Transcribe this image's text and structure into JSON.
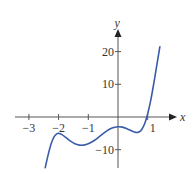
{
  "chart_data": {
    "type": "line",
    "title": "",
    "xlabel": "x",
    "ylabel": "y",
    "xlim": [
      -3.4,
      2.0
    ],
    "ylim": [
      -15.5,
      26
    ],
    "grid": false,
    "legend": null,
    "x_ticks": [
      -3,
      -2,
      -1,
      1
    ],
    "x_tick_labels": [
      "−3",
      "−2",
      "−1",
      "1"
    ],
    "y_ticks": [
      20,
      10,
      -10
    ],
    "y_tick_labels": [
      "20",
      "10",
      "−10"
    ],
    "series": [
      {
        "name": "f(x)",
        "color": "#3a5ba8",
        "x": [
          -2.45,
          -2.35,
          -2.25,
          -2.15,
          -2.05,
          -2.0,
          -1.9,
          -1.75,
          -1.6,
          -1.45,
          -1.3,
          -1.15,
          -1.0,
          -0.8,
          -0.6,
          -0.4,
          -0.2,
          0.0,
          0.15,
          0.3,
          0.45,
          0.6,
          0.7,
          0.8,
          0.9,
          1.0,
          1.1,
          1.2,
          1.3,
          1.41
        ],
        "y": [
          -15.5,
          -11.5,
          -8.2,
          -6.0,
          -5.1,
          -5.0,
          -5.3,
          -6.3,
          -7.4,
          -8.2,
          -8.6,
          -8.6,
          -8.2,
          -7.2,
          -5.8,
          -4.4,
          -3.4,
          -3.0,
          -3.1,
          -3.6,
          -4.2,
          -4.7,
          -4.6,
          -3.8,
          -2.0,
          1.0,
          5.0,
          10.0,
          15.5,
          21.5
        ]
      }
    ],
    "annotations": []
  },
  "axes": {
    "x_label": "x",
    "y_label": "y"
  },
  "colors": {
    "axis": "#555555",
    "curve": "#3a5ba8"
  }
}
